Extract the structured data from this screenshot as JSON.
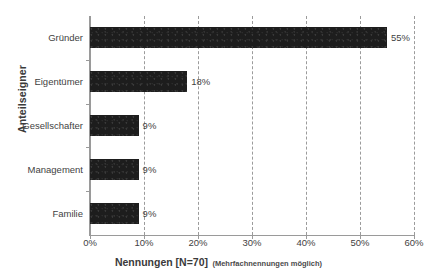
{
  "chart_data": {
    "type": "bar",
    "orientation": "horizontal",
    "title": "",
    "categories": [
      "Gründer",
      "Eigentümer",
      "Gesellschafter",
      "Management",
      "Familie"
    ],
    "values": [
      55,
      18,
      9,
      9,
      9
    ],
    "value_labels": [
      "55%",
      "18%",
      "9%",
      "9%",
      "9%"
    ],
    "xlabel": "Nennungen [N=70]",
    "xlabel_note": "(Mehrfachnennungen möglich)",
    "ylabel": "Anteilseigner",
    "xlim": [
      0,
      60
    ],
    "xticks": [
      0,
      10,
      20,
      30,
      40,
      50,
      60
    ],
    "xtick_labels": [
      "0%",
      "10%",
      "20%",
      "30%",
      "40%",
      "50%",
      "60%"
    ],
    "grid": "vertical-dashed",
    "legend": "none",
    "bar_color": "#1d1d1d",
    "grid_color": "#9b9b9b",
    "axis_color": "#9a9a9a",
    "background_color": "#ffffff"
  }
}
